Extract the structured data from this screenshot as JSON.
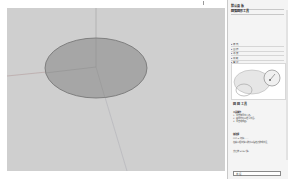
{
  "app": {
    "window_region": "3d-modeling-viewport"
  },
  "viewport": {
    "background": "#cfcfcf",
    "shape": {
      "type": "ellipse",
      "fill": "#a6a6a6",
      "stroke": "#6f6f6f"
    },
    "axes": {
      "green": "#8fa88f",
      "red": "#b08a8a",
      "blue": "#9aa0b0"
    }
  },
  "instructor": {
    "title": "默认面板",
    "subtitle": "圆弧圆形工具",
    "list": [
      "▸ 样式",
      "▸ 图层",
      "▸ 场景",
      "▸ 阴影",
      "▸ 雾化",
      "▸ 柔化边线"
    ],
    "tool_title": "圆 圆 工具",
    "sections": [
      {
        "heading": "工具操作",
        "lines": [
          "1. 单击放置中心点。",
          "2. 移动光标以定义半径。",
          "3. 单击完成圆。"
        ]
      },
      {
        "heading": "修改键",
        "lines": [
          "Ctrl = 切换……",
          "在输入框中键入数值以指定边数或半径，",
          "然后按 Enter 键。"
        ]
      }
    ],
    "measurements_label": "半径",
    "measurements_value": ""
  }
}
